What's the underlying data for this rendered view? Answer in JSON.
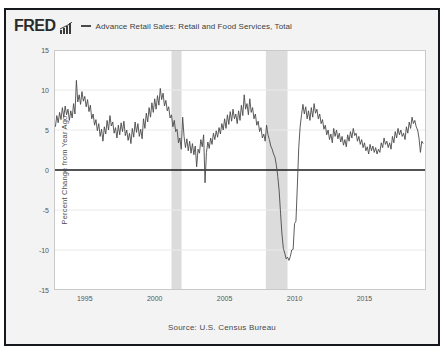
{
  "header": {
    "logo_text": "FRED",
    "logo_mark_icon": "mini-bar-chart-icon",
    "legend_dash_icon": "legend-line-icon",
    "series_label": "Advance Retail Sales: Retail and Food Services, Total"
  },
  "footer": {
    "source": "Source: U.S. Census Bureau"
  },
  "colors": {
    "line": "#4a4a4a",
    "zero_line": "#1a1a1a",
    "recession_band": "#dcdcdc",
    "plot_background": "#ffffff",
    "figure_background": "#f3f3f3",
    "frame": "#15181c",
    "grid": "#eaeaea",
    "text": "#4d4d4d"
  },
  "chart_data": {
    "type": "line",
    "title": "Advance Retail Sales: Retail and Food Services, Total",
    "xlabel": "",
    "ylabel": "Percent Change from Year Ago",
    "source": "Source: U.S. Census Bureau",
    "grid": true,
    "legend_position": "top",
    "xlim": [
      1992.8,
      2019.4
    ],
    "ylim": [
      -15,
      15
    ],
    "yticks": [
      15,
      10,
      5,
      0,
      -5,
      -10,
      -15
    ],
    "ytick_labels": [
      "15",
      "10",
      "5",
      "0",
      "-5",
      "-10",
      "-15"
    ],
    "xticks": [
      1995,
      2000,
      2005,
      2010,
      2015
    ],
    "xtick_labels": [
      "1995",
      "2000",
      "2005",
      "2010",
      "2015"
    ],
    "zero_line": 0,
    "shaded_regions": [
      {
        "label": "recession-2001",
        "x0": 2001.2,
        "x1": 2001.92
      },
      {
        "label": "recession-2008",
        "x0": 2007.95,
        "x1": 2009.5
      }
    ],
    "series": [
      {
        "name": "Advance Retail Sales: Retail and Food Services, Total",
        "color": "#4a4a4a",
        "x": [
          1992.9,
          1993.0,
          1993.1,
          1993.2,
          1993.3,
          1993.4,
          1993.5,
          1993.6,
          1993.7,
          1993.8,
          1993.9,
          1994.0,
          1994.1,
          1994.2,
          1994.3,
          1994.4,
          1994.5,
          1994.6,
          1994.7,
          1994.8,
          1994.9,
          1995.0,
          1995.1,
          1995.2,
          1995.3,
          1995.4,
          1995.5,
          1995.6,
          1995.7,
          1995.8,
          1995.9,
          1996.0,
          1996.1,
          1996.2,
          1996.3,
          1996.4,
          1996.5,
          1996.6,
          1996.7,
          1996.8,
          1996.9,
          1997.0,
          1997.1,
          1997.2,
          1997.3,
          1997.4,
          1997.5,
          1997.6,
          1997.7,
          1997.8,
          1997.9,
          1998.0,
          1998.1,
          1998.2,
          1998.3,
          1998.4,
          1998.5,
          1998.6,
          1998.7,
          1998.8,
          1998.9,
          1999.0,
          1999.1,
          1999.2,
          1999.3,
          1999.4,
          1999.5,
          1999.6,
          1999.7,
          1999.8,
          1999.9,
          2000.0,
          2000.1,
          2000.2,
          2000.3,
          2000.4,
          2000.5,
          2000.6,
          2000.7,
          2000.8,
          2000.9,
          2001.0,
          2001.1,
          2001.2,
          2001.3,
          2001.4,
          2001.5,
          2001.6,
          2001.7,
          2001.8,
          2001.9,
          2002.0,
          2002.1,
          2002.2,
          2002.3,
          2002.4,
          2002.5,
          2002.6,
          2002.7,
          2002.8,
          2002.9,
          2003.0,
          2003.1,
          2003.2,
          2003.3,
          2003.4,
          2003.5,
          2003.6,
          2003.7,
          2003.8,
          2003.9,
          2004.0,
          2004.1,
          2004.2,
          2004.3,
          2004.4,
          2004.5,
          2004.6,
          2004.7,
          2004.8,
          2004.9,
          2005.0,
          2005.1,
          2005.2,
          2005.3,
          2005.4,
          2005.5,
          2005.6,
          2005.7,
          2005.8,
          2005.9,
          2006.0,
          2006.1,
          2006.2,
          2006.3,
          2006.4,
          2006.5,
          2006.6,
          2006.7,
          2006.8,
          2006.9,
          2007.0,
          2007.1,
          2007.2,
          2007.3,
          2007.4,
          2007.5,
          2007.6,
          2007.7,
          2007.8,
          2007.9,
          2008.0,
          2008.1,
          2008.2,
          2008.3,
          2008.4,
          2008.5,
          2008.6,
          2008.7,
          2008.8,
          2008.9,
          2009.0,
          2009.1,
          2009.2,
          2009.3,
          2009.4,
          2009.5,
          2009.6,
          2009.7,
          2009.8,
          2009.9,
          2010.0,
          2010.1,
          2010.2,
          2010.3,
          2010.4,
          2010.5,
          2010.6,
          2010.7,
          2010.8,
          2010.9,
          2011.0,
          2011.1,
          2011.2,
          2011.3,
          2011.4,
          2011.5,
          2011.6,
          2011.7,
          2011.8,
          2011.9,
          2012.0,
          2012.1,
          2012.2,
          2012.3,
          2012.4,
          2012.5,
          2012.6,
          2012.7,
          2012.8,
          2012.9,
          2013.0,
          2013.1,
          2013.2,
          2013.3,
          2013.4,
          2013.5,
          2013.6,
          2013.7,
          2013.8,
          2013.9,
          2014.0,
          2014.1,
          2014.2,
          2014.3,
          2014.4,
          2014.5,
          2014.6,
          2014.7,
          2014.8,
          2014.9,
          2015.0,
          2015.1,
          2015.2,
          2015.3,
          2015.4,
          2015.5,
          2015.6,
          2015.7,
          2015.8,
          2015.9,
          2016.0,
          2016.1,
          2016.2,
          2016.3,
          2016.4,
          2016.5,
          2016.6,
          2016.7,
          2016.8,
          2016.9,
          2017.0,
          2017.1,
          2017.2,
          2017.3,
          2017.4,
          2017.5,
          2017.6,
          2017.7,
          2017.8,
          2017.9,
          2018.0,
          2018.1,
          2018.2,
          2018.3,
          2018.4,
          2018.5,
          2018.6,
          2018.7,
          2018.8,
          2018.9,
          2019.0,
          2019.1,
          2019.2
        ],
        "y": [
          5.4,
          6.8,
          5.9,
          7.2,
          6.3,
          7.8,
          6.6,
          8.0,
          6.9,
          7.6,
          6.2,
          7.4,
          6.5,
          8.3,
          7.0,
          11.2,
          8.5,
          9.4,
          8.2,
          9.8,
          8.6,
          9.2,
          7.9,
          8.8,
          7.3,
          8.1,
          6.4,
          7.0,
          5.6,
          6.3,
          4.9,
          5.8,
          4.2,
          5.1,
          3.6,
          5.4,
          4.5,
          6.2,
          5.0,
          6.8,
          5.5,
          6.0,
          4.6,
          5.3,
          4.0,
          5.6,
          4.4,
          5.9,
          4.8,
          6.1,
          4.3,
          5.0,
          3.7,
          4.6,
          3.3,
          5.2,
          4.1,
          6.0,
          4.7,
          5.8,
          4.2,
          5.1,
          3.9,
          6.4,
          5.2,
          7.1,
          6.0,
          7.8,
          6.6,
          8.4,
          7.2,
          8.9,
          7.6,
          9.3,
          8.1,
          10.2,
          8.8,
          9.6,
          8.0,
          8.7,
          7.4,
          7.9,
          6.5,
          6.9,
          5.4,
          6.2,
          4.8,
          5.1,
          3.4,
          4.0,
          2.6,
          6.6,
          4.2,
          2.8,
          3.9,
          2.4,
          3.6,
          2.1,
          3.3,
          1.9,
          3.0,
          0.4,
          2.6,
          2.1,
          3.8,
          2.9,
          4.4,
          -1.6,
          2.2,
          3.5,
          2.7,
          4.0,
          3.2,
          4.6,
          3.8,
          4.9,
          4.1,
          5.3,
          4.5,
          5.8,
          5.0,
          6.4,
          5.2,
          6.9,
          5.7,
          7.3,
          6.1,
          7.6,
          6.4,
          7.0,
          5.8,
          7.4,
          6.2,
          8.1,
          6.8,
          9.4,
          7.6,
          8.3,
          6.9,
          8.9,
          7.2,
          7.8,
          6.4,
          7.0,
          5.6,
          6.1,
          4.8,
          5.3,
          4.0,
          4.5,
          3.6,
          5.6,
          4.4,
          3.8,
          3.0,
          2.6,
          2.0,
          1.6,
          0.6,
          -0.8,
          -2.6,
          -5.4,
          -8.0,
          -9.8,
          -10.4,
          -11.1,
          -10.9,
          -11.3,
          -10.8,
          -10.0,
          -9.9,
          -6.7,
          -6.4,
          -2.0,
          2.8,
          5.4,
          6.9,
          8.2,
          7.0,
          7.9,
          6.4,
          7.4,
          6.2,
          7.8,
          6.6,
          8.3,
          7.1,
          7.6,
          6.4,
          7.0,
          5.8,
          6.3,
          5.1,
          5.6,
          4.4,
          5.0,
          3.8,
          4.5,
          3.4,
          5.2,
          4.2,
          5.0,
          3.9,
          4.6,
          3.5,
          4.2,
          3.1,
          3.8,
          2.9,
          4.4,
          3.6,
          4.8,
          4.0,
          5.2,
          4.3,
          4.6,
          3.6,
          4.2,
          3.2,
          3.8,
          2.8,
          3.4,
          2.4,
          2.9,
          2.0,
          3.2,
          2.4,
          3.0,
          2.2,
          2.8,
          2.0,
          2.6,
          2.2,
          3.4,
          2.8,
          4.0,
          3.2,
          3.6,
          2.8,
          3.4,
          2.6,
          4.2,
          3.4,
          4.8,
          4.0,
          5.2,
          4.4,
          5.0,
          4.2,
          4.6,
          3.8,
          5.4,
          4.6,
          6.0,
          5.2,
          6.6,
          5.8,
          6.2,
          5.4,
          5.0,
          4.0,
          2.2,
          3.6,
          3.3
        ]
      }
    ]
  }
}
